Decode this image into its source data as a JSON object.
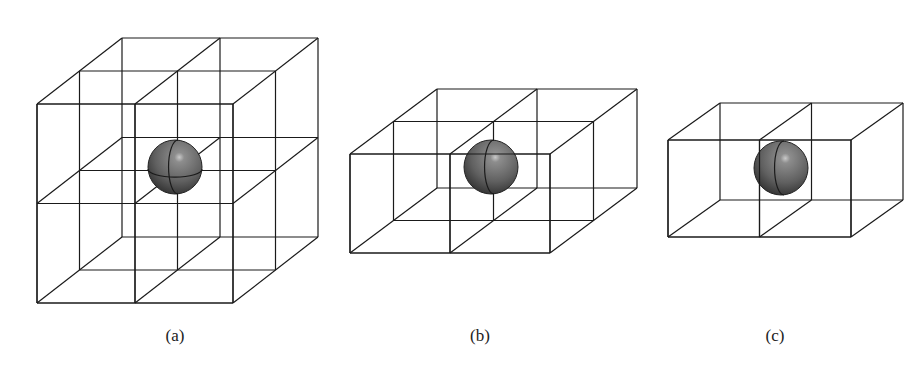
{
  "figure": {
    "panels": [
      {
        "id": "a",
        "label": "(a)",
        "label_pos": [
          175,
          326
        ],
        "grid": [
          2,
          2,
          2
        ],
        "front": {
          "x0": 37,
          "y0": 104,
          "x1": 233,
          "y1": 303
        },
        "depth_offset": [
          85,
          -66
        ],
        "sphere": {
          "cx": 175,
          "cy": 167,
          "r": 27
        }
      },
      {
        "id": "b",
        "label": "(b)",
        "label_pos": [
          480,
          326
        ],
        "grid": [
          2,
          1,
          2
        ],
        "front": {
          "x0": 350,
          "y0": 154,
          "x1": 550,
          "y1": 253
        },
        "depth_offset": [
          87,
          -65
        ],
        "sphere": {
          "cx": 491,
          "cy": 167,
          "r": 27
        }
      },
      {
        "id": "c",
        "label": "(c)",
        "label_pos": [
          775,
          326
        ],
        "grid": [
          2,
          1,
          1
        ],
        "front": {
          "x0": 668,
          "y0": 140,
          "x1": 851,
          "y1": 237
        },
        "depth_offset": [
          52,
          -37
        ],
        "sphere": {
          "cx": 781,
          "cy": 168,
          "r": 27
        }
      }
    ],
    "colors": {
      "line": "#1a1a1a",
      "sphere_light": "#8a8a8a",
      "sphere_mid": "#5e5e5e",
      "sphere_dark": "#2e2e2e"
    }
  }
}
